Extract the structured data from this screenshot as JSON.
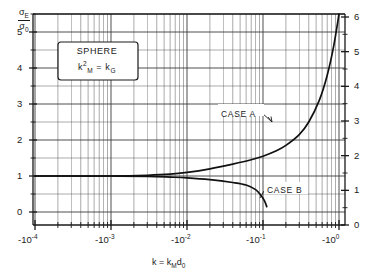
{
  "chart_data": {
    "type": "line",
    "title": "",
    "xlabel": "k = k_M d_0",
    "ylabel": "σ_E/σ_0",
    "xscale": "negative-log",
    "xlim": [
      -0.0001,
      -1.0
    ],
    "ylim_left": [
      0,
      5.5
    ],
    "ylim_right": [
      0,
      6
    ],
    "grid": true,
    "legend": "annotations",
    "annotations": [
      "SPHERE",
      "k²_M = k_G",
      "CASE A",
      "CASE B"
    ],
    "series": [
      {
        "name": "CASE A",
        "x": [
          -0.0001,
          -0.0003,
          -0.001,
          -0.003,
          -0.006,
          -0.01,
          -0.02,
          -0.04,
          -0.07,
          -0.1,
          -0.15,
          -0.2,
          -0.3,
          -0.4,
          -0.55,
          -0.7,
          -0.85,
          -1.0
        ],
        "values": [
          1.0,
          1.0,
          1.0,
          1.02,
          1.05,
          1.1,
          1.2,
          1.33,
          1.45,
          1.55,
          1.7,
          1.85,
          2.15,
          2.5,
          3.1,
          3.8,
          4.6,
          5.5
        ]
      },
      {
        "name": "CASE B",
        "x": [
          -0.0001,
          -0.0003,
          -0.001,
          -0.003,
          -0.006,
          -0.01,
          -0.02,
          -0.04,
          -0.06,
          -0.08,
          -0.095,
          -0.105,
          -0.112
        ],
        "values": [
          1.0,
          1.0,
          1.0,
          0.99,
          0.97,
          0.95,
          0.9,
          0.82,
          0.75,
          0.62,
          0.45,
          0.3,
          0.15
        ]
      }
    ]
  },
  "axes": {
    "y_title_num": "σ",
    "y_title_num_sub": "E",
    "y_title_den": "σ",
    "y_title_den_sub": "0",
    "y_left_ticks": [
      "5",
      "4",
      "3",
      "2",
      "1",
      "0"
    ],
    "y_right_ticks": [
      "6",
      "5",
      "4",
      "3",
      "2",
      "1",
      "0"
    ],
    "x_ticks": [
      {
        "base": "-10",
        "exp": "-4"
      },
      {
        "base": "-10",
        "exp": "-3"
      },
      {
        "base": "-10",
        "exp": "-2"
      },
      {
        "base": "-10",
        "exp": "-1"
      },
      {
        "base": "-10",
        "exp": "0"
      }
    ],
    "x_title_main": "k = k",
    "x_title_sub1": "M",
    "x_title_d": "d",
    "x_title_sub2": "0"
  },
  "box": {
    "line1": "SPHERE",
    "line2_k": "k",
    "line2_sub": "M",
    "line2_sup": "2",
    "line2_eq": "=",
    "line2_kg": "k",
    "line2_gsub": "G"
  },
  "labels": {
    "case_a": "CASE A",
    "case_b": "CASE B"
  },
  "colors": {
    "ink": "#1a1a1a",
    "grid": "#555555",
    "background": "#ffffff"
  }
}
